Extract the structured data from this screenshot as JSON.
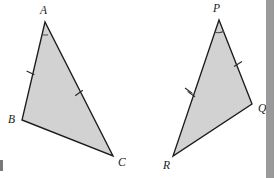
{
  "figure": {
    "background_color": "#ffffff",
    "triangle_fill": "#d2d2d2",
    "triangle_stroke": "#1c1c1c",
    "right_edge_bar_color": "#9a9a9a",
    "triangles": [
      {
        "id": "triangle-abc",
        "vertices": [
          {
            "label": "A",
            "x": 45,
            "y": 22,
            "label_x": 40,
            "label_y": 14
          },
          {
            "label": "B",
            "x": 22,
            "y": 120,
            "label_x": 8,
            "label_y": 123
          },
          {
            "label": "C",
            "x": 113,
            "y": 156,
            "label_x": 118,
            "label_y": 166
          }
        ],
        "ticks": [
          {
            "side": "AB",
            "x": 30.5,
            "y": 73,
            "count": 1
          },
          {
            "side": "AC",
            "x": 79,
            "y": 93,
            "count": 1
          }
        ],
        "angle_arc": {
          "vertex": "A",
          "radius": 13
        }
      },
      {
        "id": "triangle-pqr",
        "vertices": [
          {
            "label": "P",
            "x": 219,
            "y": 20,
            "label_x": 213,
            "label_y": 12
          },
          {
            "label": "Q",
            "x": 252,
            "y": 104,
            "label_x": 258,
            "label_y": 112
          },
          {
            "label": "R",
            "x": 173,
            "y": 156,
            "label_x": 163,
            "label_y": 169
          }
        ],
        "ticks": [
          {
            "side": "PR",
            "x": 190,
            "y": 92,
            "count": 2
          },
          {
            "side": "PQ",
            "x": 238,
            "y": 64,
            "count": 1
          }
        ],
        "angle_arc": {
          "vertex": "P",
          "radius": 13
        }
      }
    ]
  }
}
